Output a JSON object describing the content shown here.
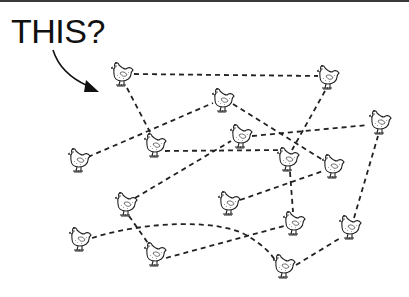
{
  "caption": {
    "text": "THIS?"
  },
  "colors": {
    "ink": "#222222",
    "background": "#ffffff",
    "rule": "#3a3a3a"
  },
  "arrow": {
    "from": [
      53,
      50
    ],
    "to": [
      96,
      90
    ],
    "points_to": "chicken-1"
  },
  "chickens": [
    {
      "id": 1,
      "x": 122,
      "y": 75
    },
    {
      "id": 2,
      "x": 328,
      "y": 78
    },
    {
      "id": 3,
      "x": 223,
      "y": 101
    },
    {
      "id": 4,
      "x": 380,
      "y": 123
    },
    {
      "id": 5,
      "x": 241,
      "y": 137
    },
    {
      "id": 6,
      "x": 155,
      "y": 146
    },
    {
      "id": 7,
      "x": 79,
      "y": 161
    },
    {
      "id": 8,
      "x": 288,
      "y": 160
    },
    {
      "id": 9,
      "x": 333,
      "y": 167
    },
    {
      "id": 10,
      "x": 126,
      "y": 205
    },
    {
      "id": 11,
      "x": 229,
      "y": 204
    },
    {
      "id": 12,
      "x": 294,
      "y": 224
    },
    {
      "id": 13,
      "x": 350,
      "y": 228
    },
    {
      "id": 14,
      "x": 80,
      "y": 240
    },
    {
      "id": 15,
      "x": 155,
      "y": 255
    },
    {
      "id": 16,
      "x": 284,
      "y": 267
    }
  ],
  "connections": [
    {
      "from": 1,
      "to": 2,
      "style": "dashed-straight"
    },
    {
      "from": 1,
      "to": 6,
      "style": "dashed-straight"
    },
    {
      "from": 7,
      "to": 3,
      "style": "dashed-straight"
    },
    {
      "from": 6,
      "to": 8,
      "style": "dashed-straight"
    },
    {
      "from": 10,
      "to": 5,
      "style": "dashed-straight"
    },
    {
      "from": 3,
      "to": 9,
      "style": "dashed-straight"
    },
    {
      "from": 5,
      "to": 4,
      "style": "dashed-straight"
    },
    {
      "from": 2,
      "to": 8,
      "style": "dashed-straight"
    },
    {
      "from": 8,
      "to": 12,
      "style": "dashed-straight"
    },
    {
      "from": 11,
      "to": 9,
      "style": "dashed-straight"
    },
    {
      "from": 10,
      "to": 15,
      "style": "dashed-straight"
    },
    {
      "from": 14,
      "to": 16,
      "style": "dashed-curve"
    },
    {
      "from": 15,
      "to": 12,
      "style": "dashed-straight"
    },
    {
      "from": 16,
      "to": 13,
      "style": "dashed-straight"
    },
    {
      "from": 13,
      "to": 4,
      "style": "dashed-straight"
    }
  ]
}
